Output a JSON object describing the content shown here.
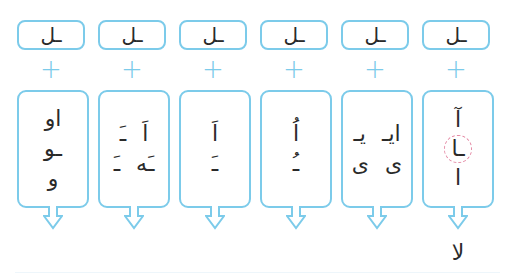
{
  "colors": {
    "border": "#7ccbea",
    "highlight": "#e48aa5",
    "text": "#2a2a2a"
  },
  "plus_symbol": "+",
  "columns": [
    {
      "top": "ـل",
      "rows": [
        [
          "او"
        ],
        [
          "ـو"
        ],
        [
          "و"
        ]
      ],
      "result": ""
    },
    {
      "top": "ـل",
      "rows": [
        [
          "اَ",
          "ـَ"
        ],
        [
          "ـَه",
          "ـَ"
        ]
      ],
      "result": ""
    },
    {
      "top": "ـل",
      "rows": [
        [
          "اَ"
        ],
        [
          "ـَ"
        ]
      ],
      "result": ""
    },
    {
      "top": "ـل",
      "rows": [
        [
          "اُ"
        ],
        [
          "ـُ"
        ]
      ],
      "result": ""
    },
    {
      "top": "ـل",
      "rows": [
        [
          "ایـ",
          "یـ"
        ],
        [
          "ی",
          "ی"
        ]
      ],
      "result": ""
    },
    {
      "top": "ـل",
      "rows": [
        [
          "آ"
        ],
        [
          "ـا"
        ],
        [
          "ا"
        ]
      ],
      "highlight_row": 1,
      "result": "لا"
    }
  ]
}
